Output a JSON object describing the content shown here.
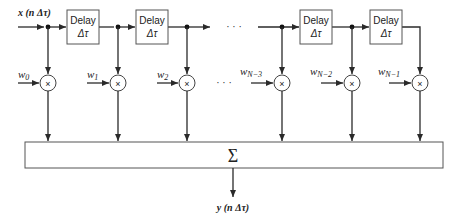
{
  "diagram": {
    "type": "tapped-delay-line-filter",
    "input_label": "x (n Δτ)",
    "output_label": "y (n Δτ)",
    "sum_symbol": "Σ",
    "ellipsis": "· · ·",
    "multiply_symbol": "×",
    "delay_blocks": [
      {
        "line1": "Delay",
        "line2": "Δτ"
      },
      {
        "line1": "Delay",
        "line2": "Δτ"
      },
      {
        "line1": "Delay",
        "line2": "Δτ"
      },
      {
        "line1": "Delay",
        "line2": "Δτ"
      }
    ],
    "weights": [
      {
        "base": "w",
        "sub": "0"
      },
      {
        "base": "w",
        "sub": "1"
      },
      {
        "base": "w",
        "sub": "2"
      },
      {
        "base": "w",
        "sub": "N−3"
      },
      {
        "base": "w",
        "sub": "N−2"
      },
      {
        "base": "w",
        "sub": "N−1"
      }
    ],
    "colors": {
      "line": "#2a2a2a",
      "box_stroke": "#555555",
      "background": "#ffffff"
    }
  }
}
